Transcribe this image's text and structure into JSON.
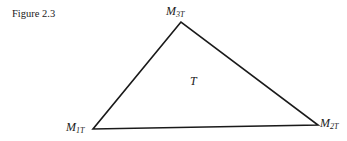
{
  "figure": {
    "caption": "Figure 2.3",
    "interior_label": "T",
    "vertices": [
      {
        "id": "M3T",
        "base": "M",
        "subscript": "3T",
        "x": 181,
        "y": 22
      },
      {
        "id": "M1T",
        "base": "M",
        "subscript": "1T",
        "x": 93,
        "y": 129
      },
      {
        "id": "M2T",
        "base": "M",
        "subscript": "2T",
        "x": 318,
        "y": 125
      }
    ],
    "stroke_color": "#1a1a1a"
  }
}
